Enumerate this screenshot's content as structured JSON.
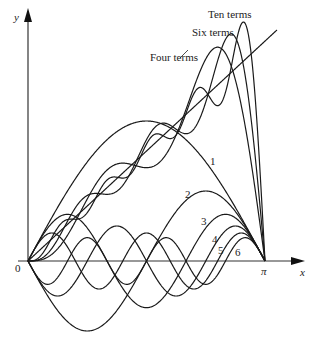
{
  "figure": {
    "axes": {
      "x_label": "x",
      "y_label": "y",
      "origin_label": "0",
      "pi_label": "π"
    },
    "term_labels": [
      "1",
      "2",
      "3",
      "4",
      "5",
      "6"
    ],
    "partial_sum_labels": {
      "four": "Four terms",
      "six": "Six terms",
      "ten": "Ten terms"
    },
    "line_color": "#1a1a1a",
    "background": "#ffffff"
  },
  "chart_data": {
    "type": "line",
    "title": "",
    "xlabel": "x",
    "ylabel": "y",
    "xlim": [
      0,
      3.1416
    ],
    "function": "y = x",
    "series": [
      {
        "name": "y = x",
        "formula": "x"
      },
      {
        "name": "1",
        "formula": "2 sin x"
      },
      {
        "name": "2",
        "formula": "-sin 2x"
      },
      {
        "name": "3",
        "formula": "(2/3) sin 3x"
      },
      {
        "name": "4",
        "formula": "-(1/2) sin 4x"
      },
      {
        "name": "5",
        "formula": "(2/5) sin 5x"
      },
      {
        "name": "6",
        "formula": "-(1/3) sin 6x"
      },
      {
        "name": "Four terms",
        "formula": "sum_{n=1..4} 2(-1)^(n+1) sin(nx)/n"
      },
      {
        "name": "Six terms",
        "formula": "sum_{n=1..6} 2(-1)^(n+1) sin(nx)/n"
      },
      {
        "name": "Ten terms",
        "formula": "sum_{n=1..10} 2(-1)^(n+1) sin(nx)/n"
      }
    ],
    "ticks": {
      "x": [
        "0",
        "π"
      ]
    },
    "grid": false,
    "legend": "inline labels"
  }
}
